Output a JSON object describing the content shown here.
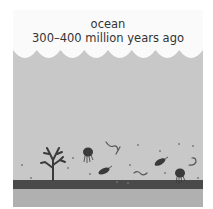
{
  "diagram": {
    "title_line1": "ocean",
    "title_line2": "300–400 million years ago",
    "colors": {
      "sky": "#fafafa",
      "water": "#c8c8c8",
      "seafloor": "#4a4a4a",
      "sediment": "#b0b0b0",
      "organisms": "#3a3a3a"
    },
    "elements": [
      "waves",
      "water",
      "coral",
      "jellyfish",
      "jellyfish",
      "trilobite",
      "trilobite",
      "worm",
      "worm",
      "worm",
      "particles",
      "seafloor",
      "sediment"
    ]
  }
}
